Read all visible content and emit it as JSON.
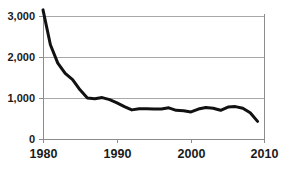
{
  "chart_data": {
    "type": "line",
    "title": "",
    "subtitle": "",
    "xlabel": "",
    "ylabel": "",
    "xlim": [
      1980,
      2010
    ],
    "ylim": [
      0,
      3000
    ],
    "xticks": [
      1980,
      1990,
      2000,
      2010
    ],
    "xtick_labels": [
      "1980",
      "1990",
      "2000",
      "2010"
    ],
    "yticks": [
      0,
      1000,
      2000,
      3000
    ],
    "ytick_labels": [
      "0",
      "1,000",
      "2,000",
      "3,000"
    ],
    "grid": "horizontal",
    "legend": "none",
    "line_color": "#111111",
    "line_width": 3,
    "gridline_color": "#a6a6a6",
    "axis_color": "#808080",
    "background": "#ffffff",
    "x": [
      1980,
      1981,
      1982,
      1983,
      1984,
      1985,
      1986,
      1987,
      1988,
      1989,
      1990,
      1991,
      1992,
      1993,
      1994,
      1995,
      1996,
      1997,
      1998,
      1999,
      2000,
      2001,
      2002,
      2003,
      2004,
      2005,
      2006,
      2007,
      2008,
      2009
    ],
    "values": [
      3150,
      2300,
      1850,
      1600,
      1450,
      1200,
      1000,
      980,
      1010,
      960,
      880,
      790,
      710,
      740,
      740,
      730,
      730,
      760,
      700,
      690,
      660,
      730,
      770,
      750,
      700,
      780,
      790,
      750,
      640,
      430
    ],
    "series": [
      {
        "name": "value",
        "values": [
          3150,
          2300,
          1850,
          1600,
          1450,
          1200,
          1000,
          980,
          1010,
          960,
          880,
          790,
          710,
          740,
          740,
          730,
          730,
          760,
          700,
          690,
          660,
          730,
          770,
          750,
          700,
          780,
          790,
          750,
          640,
          430
        ]
      }
    ]
  },
  "axes": {
    "y_labels": [
      "3,000",
      "2,000",
      "1,000",
      "0"
    ],
    "x_labels": [
      "1980",
      "1990",
      "2000",
      "2010"
    ]
  }
}
